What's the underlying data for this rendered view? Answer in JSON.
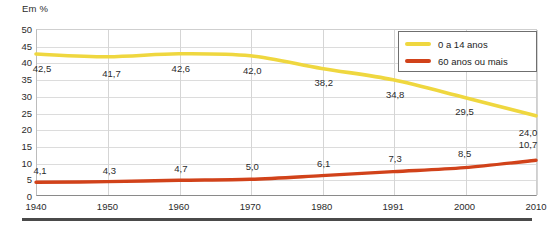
{
  "axis_unit_label": "Em %",
  "legend": {
    "position": "top-right",
    "entries": [
      {
        "label": "0 a 14 anos",
        "color": "#EFD73F"
      },
      {
        "label": "60 anos ou mais",
        "color": "#D1421A"
      }
    ]
  },
  "chart_data": {
    "type": "line",
    "title": "",
    "subtitle": "",
    "xlabel": "",
    "ylabel": "Em %",
    "x": [
      1940,
      1950,
      1960,
      1970,
      1980,
      1991,
      2000,
      2010
    ],
    "categories": [
      "1940",
      "1950",
      "1960",
      "1970",
      "1980",
      "1991",
      "2000",
      "2010"
    ],
    "xticklabels": [
      "1940",
      "1950",
      "1960",
      "1970",
      "1980",
      "1991",
      "2000",
      "2010"
    ],
    "yticklabels": [
      "0",
      "5",
      "10",
      "15",
      "20",
      "25",
      "30",
      "35",
      "40",
      "45",
      "50"
    ],
    "yticks": [
      0,
      5,
      10,
      15,
      20,
      25,
      30,
      35,
      40,
      45,
      50
    ],
    "ylim": [
      0,
      50
    ],
    "grid": true,
    "series": [
      {
        "name": "0 a 14 anos",
        "color": "#EFD73F",
        "values": [
          42.5,
          41.7,
          42.6,
          42.0,
          38.2,
          34.8,
          29.5,
          24.0
        ],
        "labels": [
          "42,5",
          "41,7",
          "42,6",
          "42,0",
          "38,2",
          "34,8",
          "29,5",
          "24,0"
        ]
      },
      {
        "name": "60 anos ou mais",
        "color": "#D1421A",
        "values": [
          4.1,
          4.3,
          4.7,
          5.0,
          6.1,
          7.3,
          8.5,
          10.7
        ],
        "labels": [
          "4,1",
          "4,3",
          "4,7",
          "5,0",
          "6,1",
          "7,3",
          "8,5",
          "10,7"
        ]
      }
    ]
  }
}
